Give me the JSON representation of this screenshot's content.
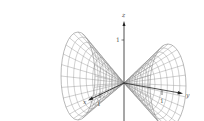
{
  "figure": {
    "axes": {
      "x": {
        "label": "x",
        "tick": "1"
      },
      "y": {
        "label": "y",
        "tick": "1"
      },
      "z": {
        "label": "z",
        "tick": "1"
      }
    },
    "colors": {
      "mesh": "#8a8a8a",
      "axis": "#222222",
      "label": "#555555"
    },
    "surfaces": [
      {
        "name": "left-nappe",
        "rim_center": [
          78,
          76
        ],
        "rim_rx": 17,
        "rim_ry": 44
      },
      {
        "name": "right-nappe",
        "rim_center": [
          168,
          86
        ],
        "rim_rx": 18,
        "rim_ry": 42
      }
    ],
    "apex": [
      124,
      83
    ]
  }
}
